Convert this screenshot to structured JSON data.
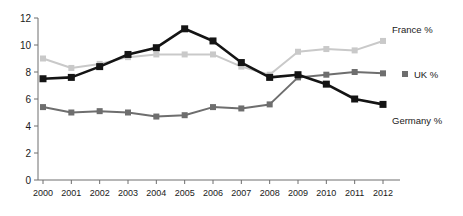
{
  "chart_data": {
    "type": "line",
    "title": "",
    "subtitle": "",
    "xlabel": "",
    "ylabel": "",
    "categories": [
      "2000",
      "2001",
      "2002",
      "2003",
      "2004",
      "2005",
      "2006",
      "2007",
      "2008",
      "2009",
      "2010",
      "2011",
      "2012"
    ],
    "xlim": [
      2000,
      2012
    ],
    "ylim": [
      0,
      12
    ],
    "y_ticks": [
      0,
      2,
      4,
      6,
      8,
      10,
      12
    ],
    "grid": false,
    "legend_position": "right-inline",
    "series": [
      {
        "name": "Germany %",
        "color": "#141414",
        "marker": "square",
        "values": [
          7.5,
          7.6,
          8.4,
          9.3,
          9.8,
          11.2,
          10.3,
          8.7,
          7.6,
          7.8,
          7.1,
          6.0,
          5.6
        ]
      },
      {
        "name": "France %",
        "color": "#c9c9c9",
        "marker": "square",
        "values": [
          9.0,
          8.3,
          8.6,
          9.1,
          9.3,
          9.3,
          9.3,
          8.4,
          7.8,
          9.5,
          9.7,
          9.6,
          10.3
        ]
      },
      {
        "name": "UK %",
        "color": "#6e6e6e",
        "marker": "square",
        "values": [
          5.4,
          5.0,
          5.1,
          5.0,
          4.7,
          4.8,
          5.4,
          5.3,
          5.6,
          7.6,
          7.8,
          8.0,
          7.9
        ]
      }
    ],
    "annotations": [
      {
        "text": "France %",
        "series": "France %"
      },
      {
        "text": "UK %",
        "series": "UK %"
      },
      {
        "text": "Germany %",
        "series": "Germany %"
      }
    ]
  },
  "axis": {
    "y_tick_labels": [
      "12",
      "10",
      "8",
      "6",
      "4",
      "2",
      "0"
    ],
    "x_tick_labels": [
      "2000",
      "2001",
      "2002",
      "2003",
      "2004",
      "2005",
      "2006",
      "2007",
      "2008",
      "2009",
      "2010",
      "2011",
      "2012"
    ]
  },
  "colors": {
    "germany": "#141414",
    "france": "#c9c9c9",
    "uk": "#6e6e6e",
    "axis": "#6e6e6e",
    "text": "#1a1a1a",
    "background": "#ffffff"
  }
}
